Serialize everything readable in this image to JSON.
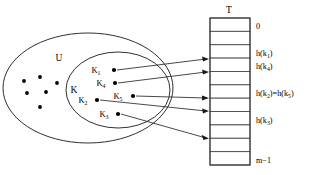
{
  "figure": {
    "background_color": "#ffffff",
    "stroke_color": "#1a1a1a"
  },
  "universe": {
    "label": "U",
    "label_x": 59,
    "label_y": 61,
    "center_x": 88,
    "center_y": 88,
    "radius_x": 85,
    "radius_y": 55,
    "dots": [
      {
        "x": 24,
        "y": 81
      },
      {
        "x": 40,
        "y": 77
      },
      {
        "x": 27,
        "y": 93
      },
      {
        "x": 46,
        "y": 92
      },
      {
        "x": 40,
        "y": 107
      },
      {
        "x": 57,
        "y": 83
      }
    ]
  },
  "keyset": {
    "label": "K",
    "label_x": 74,
    "label_y": 93,
    "center_x": 118,
    "center_y": 90,
    "radius_x": 52,
    "radius_y": 38
  },
  "keys": [
    {
      "name": "K",
      "subscript": "1",
      "label_x": 96,
      "label_y": 73,
      "dot_x": 114,
      "dot_y": 70
    },
    {
      "name": "K",
      "subscript": "4",
      "label_x": 101,
      "label_y": 86,
      "dot_x": 115,
      "dot_y": 83
    },
    {
      "name": "K",
      "subscript": "5",
      "label_x": 118,
      "label_y": 99,
      "dot_x": 133,
      "dot_y": 96
    },
    {
      "name": "K",
      "subscript": "2",
      "label_x": 83,
      "label_y": 103,
      "dot_x": 97,
      "dot_y": 100
    },
    {
      "name": "K",
      "subscript": "3",
      "label_x": 104,
      "label_y": 117,
      "dot_x": 118,
      "dot_y": 114
    }
  ],
  "arrows": [
    {
      "from_key": "K1",
      "x1": 117,
      "y1": 70,
      "x2": 208,
      "y2": 59
    },
    {
      "from_key": "K4",
      "x1": 118,
      "y1": 83,
      "x2": 208,
      "y2": 72
    },
    {
      "from_key": "K5",
      "x1": 136,
      "y1": 96,
      "x2": 208,
      "y2": 98
    },
    {
      "from_key": "K2",
      "x1": 100,
      "y1": 100,
      "x2": 208,
      "y2": 111
    },
    {
      "from_key": "K3",
      "x1": 121,
      "y1": 114,
      "x2": 208,
      "y2": 138
    }
  ],
  "table": {
    "title": "T",
    "title_x": 229,
    "title_y": 13,
    "left": 210,
    "top": 18,
    "width": 40,
    "height": 147,
    "slot_count": 11,
    "slots": [
      {
        "index": 0,
        "label": "0",
        "has_sub": false
      },
      {
        "index": 1,
        "label": "",
        "has_sub": false
      },
      {
        "index": 2,
        "label": "h(k",
        "subscript": "1",
        "label_tail": ")",
        "has_sub": true
      },
      {
        "index": 3,
        "label": "h(k",
        "subscript": "4",
        "label_tail": ")",
        "has_sub": true
      },
      {
        "index": 4,
        "label": "",
        "has_sub": false
      },
      {
        "index": 5,
        "label": "h(k",
        "subscript": "2",
        "label_mid": ")=h(k",
        "subscript2": "5",
        "label_tail": ")",
        "has_sub": true
      },
      {
        "index": 6,
        "label": "",
        "has_sub": false
      },
      {
        "index": 7,
        "label": "h(k",
        "subscript": "3",
        "label_tail": ")",
        "has_sub": true
      },
      {
        "index": 8,
        "label": "",
        "has_sub": false
      },
      {
        "index": 9,
        "label": "",
        "has_sub": false
      },
      {
        "index": 10,
        "label": "m−1",
        "has_sub": false
      }
    ],
    "label_x": 256
  }
}
